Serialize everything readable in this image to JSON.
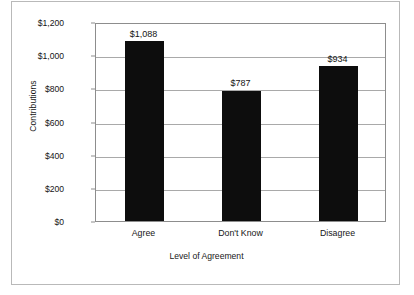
{
  "chart_data": {
    "type": "bar",
    "title": "",
    "subtitle": "",
    "xlabel": "Level of Agreement",
    "ylabel": "Contributions",
    "categories": [
      "Agree",
      "Don't Know",
      "Disagree"
    ],
    "values": [
      1088,
      787,
      934
    ],
    "value_labels": [
      "$1,088",
      "$787",
      "$934"
    ],
    "ylim": [
      0,
      1200
    ],
    "ytick_values": [
      0,
      200,
      400,
      600,
      800,
      1000,
      1200
    ],
    "ytick_labels": [
      "$0",
      "$200",
      "$400",
      "$600",
      "$800",
      "$1,000",
      "$1,200"
    ],
    "grid": true,
    "legend": false,
    "legend_position": "none",
    "bar_color": "#0d0d0d",
    "plot_border_color": "#8d8d8d",
    "gridline_color": "#a9a9a9",
    "figure_border_color": "#b9b9b9",
    "background_color": "#ffffff"
  }
}
